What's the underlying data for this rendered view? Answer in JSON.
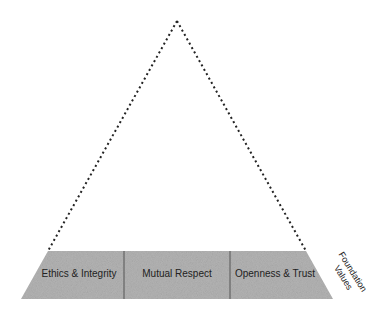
{
  "diagram": {
    "type": "pyramid",
    "fill_color": "#b4b4b4",
    "line_color": "#222222",
    "base_segments": [
      {
        "label": "Ethics & Integrity"
      },
      {
        "label": "Mutual Respect"
      },
      {
        "label": "Openness & Trust"
      }
    ],
    "side_label": {
      "line1": "Foundation",
      "line2": "Values"
    }
  }
}
